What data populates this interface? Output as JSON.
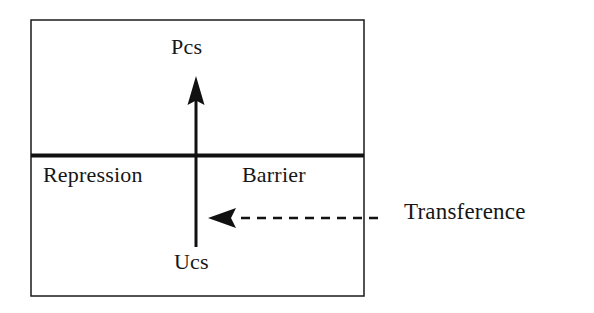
{
  "figure": {
    "type": "diagram",
    "background_color": "#ffffff",
    "ink_color": "#161616"
  },
  "frame": {
    "name": "outer-box",
    "x": 31,
    "y": 20,
    "width": 333,
    "height": 276,
    "stroke_width": 1.5,
    "stroke_color": "#1a1a1a"
  },
  "barrier_line": {
    "name": "repression-barrier-line",
    "x1": 31,
    "x2": 364,
    "y": 155,
    "stroke_width": 4,
    "stroke_color": "#111111"
  },
  "vertical_arrow": {
    "name": "ucs-to-pcs-arrow",
    "x": 196,
    "tail_y": 247,
    "tip_y": 76,
    "stroke_width": 3,
    "stroke_color": "#111111",
    "arrowhead": "solid-triangle-up"
  },
  "transference_arrow": {
    "name": "transference-dashed-arrow",
    "tip_x": 208,
    "tail_x": 378,
    "y": 218,
    "stroke_width": 2.4,
    "stroke_color": "#111111",
    "dash_pattern": "9 7",
    "arrowhead": "solid-triangle-left"
  },
  "labels": {
    "pcs": "Pcs",
    "ucs": "Ucs",
    "repression": "Repression",
    "barrier": "Barrier",
    "transference": "Transference"
  }
}
